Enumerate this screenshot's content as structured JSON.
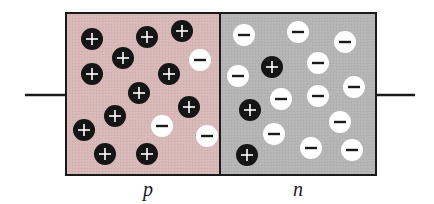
{
  "diagram": {
    "colors": {
      "p_region": "#d9b8b8",
      "n_region": "#b5b5b5",
      "border": "#1a1a1a",
      "hole": "#151515",
      "electron": "#ffffff"
    },
    "regions": [
      {
        "name": "p",
        "label": "p",
        "x": 66,
        "width": 154
      },
      {
        "name": "n",
        "label": "n",
        "x": 220,
        "width": 156
      }
    ],
    "box": {
      "top": 13,
      "bottom": 175
    },
    "wires": [
      {
        "side": "left",
        "x1": 25,
        "x2": 66,
        "y": 95
      },
      {
        "side": "right",
        "x1": 376,
        "x2": 415,
        "y": 95
      }
    ],
    "carriers": {
      "p_region": [
        {
          "type": "plus",
          "x": 92,
          "y": 39
        },
        {
          "type": "plus",
          "x": 147,
          "y": 37
        },
        {
          "type": "plus",
          "x": 182,
          "y": 31
        },
        {
          "type": "plus",
          "x": 123,
          "y": 58
        },
        {
          "type": "minus",
          "x": 200,
          "y": 60
        },
        {
          "type": "plus",
          "x": 92,
          "y": 74
        },
        {
          "type": "plus",
          "x": 169,
          "y": 74
        },
        {
          "type": "plus",
          "x": 139,
          "y": 93
        },
        {
          "type": "plus",
          "x": 189,
          "y": 107
        },
        {
          "type": "plus",
          "x": 115,
          "y": 116
        },
        {
          "type": "minus",
          "x": 162,
          "y": 126
        },
        {
          "type": "plus",
          "x": 84,
          "y": 130
        },
        {
          "type": "minus",
          "x": 207,
          "y": 136
        },
        {
          "type": "plus",
          "x": 105,
          "y": 154
        },
        {
          "type": "plus",
          "x": 147,
          "y": 154
        }
      ],
      "n_region": [
        {
          "type": "minus",
          "x": 244,
          "y": 35
        },
        {
          "type": "minus",
          "x": 298,
          "y": 32
        },
        {
          "type": "minus",
          "x": 345,
          "y": 42
        },
        {
          "type": "minus",
          "x": 318,
          "y": 63
        },
        {
          "type": "plus",
          "x": 272,
          "y": 67
        },
        {
          "type": "minus",
          "x": 238,
          "y": 76
        },
        {
          "type": "minus",
          "x": 354,
          "y": 87
        },
        {
          "type": "minus",
          "x": 318,
          "y": 96
        },
        {
          "type": "minus",
          "x": 281,
          "y": 99
        },
        {
          "type": "plus",
          "x": 250,
          "y": 110
        },
        {
          "type": "minus",
          "x": 340,
          "y": 122
        },
        {
          "type": "minus",
          "x": 274,
          "y": 134
        },
        {
          "type": "minus",
          "x": 311,
          "y": 148
        },
        {
          "type": "minus",
          "x": 352,
          "y": 150
        },
        {
          "type": "plus",
          "x": 247,
          "y": 155
        }
      ]
    },
    "labels": {
      "p": {
        "text": "p",
        "x": 148,
        "y": 196
      },
      "n": {
        "text": "n",
        "x": 298,
        "y": 196
      }
    }
  }
}
